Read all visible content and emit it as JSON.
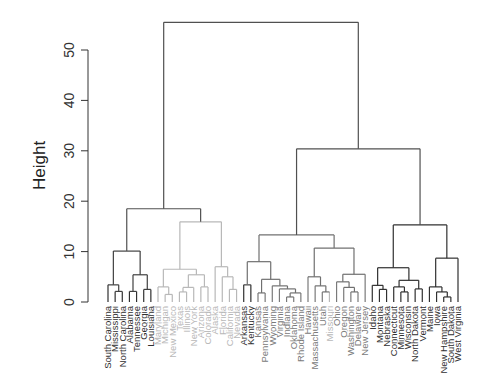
{
  "chart_data": {
    "type": "dendrogram",
    "title": "",
    "xlabel": "",
    "ylabel": "Height",
    "ylim": [
      0,
      55.5
    ],
    "yticks": [
      0,
      10,
      20,
      30,
      40,
      50
    ],
    "leaves": [
      {
        "label": "South Carolina",
        "color": "#303030"
      },
      {
        "label": "Mississippi",
        "color": "#303030"
      },
      {
        "label": "North Carolina",
        "color": "#303030"
      },
      {
        "label": "Alabama",
        "color": "#303030"
      },
      {
        "label": "Tennessee",
        "color": "#303030"
      },
      {
        "label": "Georgia",
        "color": "#303030"
      },
      {
        "label": "Louisiana",
        "color": "#303030"
      },
      {
        "label": "Maryland",
        "color": "#b8b8b8"
      },
      {
        "label": "Michigan",
        "color": "#b8b8b8"
      },
      {
        "label": "New Mexico",
        "color": "#b8b8b8"
      },
      {
        "label": "Texas",
        "color": "#b8b8b8"
      },
      {
        "label": "Illinois",
        "color": "#b8b8b8"
      },
      {
        "label": "New York",
        "color": "#b8b8b8"
      },
      {
        "label": "Arizona",
        "color": "#b8b8b8"
      },
      {
        "label": "Colorado",
        "color": "#b8b8b8"
      },
      {
        "label": "Alaska",
        "color": "#b8b8b8"
      },
      {
        "label": "Florida",
        "color": "#b8b8b8"
      },
      {
        "label": "California",
        "color": "#b8b8b8"
      },
      {
        "label": "Nevada",
        "color": "#b8b8b8"
      },
      {
        "label": "Arkansas",
        "color": "#303030"
      },
      {
        "label": "Kentucky",
        "color": "#303030"
      },
      {
        "label": "Kansas",
        "color": "#7a7a7a"
      },
      {
        "label": "Pennsylvania",
        "color": "#7a7a7a"
      },
      {
        "label": "Wyoming",
        "color": "#7a7a7a"
      },
      {
        "label": "Virginia",
        "color": "#7a7a7a"
      },
      {
        "label": "Indiana",
        "color": "#7a7a7a"
      },
      {
        "label": "Oklahoma",
        "color": "#7a7a7a"
      },
      {
        "label": "Rhode Island",
        "color": "#7a7a7a"
      },
      {
        "label": "Hawaii",
        "color": "#7a7a7a"
      },
      {
        "label": "Massachusetts",
        "color": "#7a7a7a"
      },
      {
        "label": "Utah",
        "color": "#7a7a7a"
      },
      {
        "label": "Missouri",
        "color": "#b8b8b8"
      },
      {
        "label": "Ohio",
        "color": "#7a7a7a"
      },
      {
        "label": "Oregon",
        "color": "#7a7a7a"
      },
      {
        "label": "Washington",
        "color": "#7a7a7a"
      },
      {
        "label": "Delaware",
        "color": "#7a7a7a"
      },
      {
        "label": "New Jersey",
        "color": "#7a7a7a"
      },
      {
        "label": "Idaho",
        "color": "#303030"
      },
      {
        "label": "Montana",
        "color": "#303030"
      },
      {
        "label": "Nebraska",
        "color": "#303030"
      },
      {
        "label": "Connecticut",
        "color": "#303030"
      },
      {
        "label": "Minnesota",
        "color": "#303030"
      },
      {
        "label": "Wisconsin",
        "color": "#303030"
      },
      {
        "label": "North Dakota",
        "color": "#303030"
      },
      {
        "label": "Vermont",
        "color": "#303030"
      },
      {
        "label": "Maine",
        "color": "#303030"
      },
      {
        "label": "Iowa",
        "color": "#303030"
      },
      {
        "label": "New Hampshire",
        "color": "#303030"
      },
      {
        "label": "South Dakota",
        "color": "#303030"
      },
      {
        "label": "West Virginia",
        "color": "#303030"
      }
    ],
    "tree": {
      "h": 55.5,
      "c": "#505050",
      "k": [
        {
          "h": 18.5,
          "c": "#505050",
          "k": [
            {
              "h": 10.1,
              "c": "#404040",
              "k": [
                {
                  "h": 3.4,
                  "c": "#404040",
                  "k": [
                    0,
                    {
                      "h": 2.1,
                      "c": "#404040",
                      "k": [
                        1,
                        2
                      ]
                    }
                  ]
                },
                {
                  "h": 5.4,
                  "c": "#404040",
                  "k": [
                    {
                      "h": 2.1,
                      "c": "#404040",
                      "k": [
                        3,
                        4
                      ]
                    },
                    {
                      "h": 2.5,
                      "c": "#404040",
                      "k": [
                        5,
                        6
                      ]
                    }
                  ]
                }
              ]
            },
            {
              "h": 15.9,
              "c": "#b8b8b8",
              "k": [
                {
                  "h": 6.5,
                  "c": "#b8b8b8",
                  "k": [
                    {
                      "h": 3.0,
                      "c": "#b8b8b8",
                      "k": [
                        7,
                        {
                          "h": 1.5,
                          "c": "#b8b8b8",
                          "k": [
                            8,
                            9
                          ]
                        }
                      ]
                    },
                    {
                      "h": 5.4,
                      "c": "#b8b8b8",
                      "k": [
                        {
                          "h": 2.9,
                          "c": "#b8b8b8",
                          "k": [
                            {
                              "h": 2.0,
                              "c": "#b8b8b8",
                              "k": [
                                10,
                                11
                              ]
                            },
                            12
                          ]
                        },
                        {
                          "h": 3.0,
                          "c": "#b8b8b8",
                          "k": [
                            13,
                            14
                          ]
                        }
                      ]
                    }
                  ]
                },
                {
                  "h": 7.0,
                  "c": "#b8b8b8",
                  "k": [
                    15,
                    {
                      "h": 5.0,
                      "c": "#b8b8b8",
                      "k": [
                        16,
                        {
                          "h": 2.5,
                          "c": "#b8b8b8",
                          "k": [
                            17,
                            18
                          ]
                        }
                      ]
                    }
                  ]
                }
              ]
            }
          ]
        },
        {
          "h": 30.4,
          "c": "#505050",
          "k": [
            {
              "h": 13.3,
              "c": "#707070",
              "k": [
                {
                  "h": 8.0,
                  "c": "#707070",
                  "k": [
                    {
                      "h": 3.4,
                      "c": "#404040",
                      "k": [
                        19,
                        20
                      ]
                    },
                    {
                      "h": 4.5,
                      "c": "#707070",
                      "k": [
                        {
                          "h": 1.8,
                          "c": "#707070",
                          "k": [
                            21,
                            22
                          ]
                        },
                        {
                          "h": 3.2,
                          "c": "#707070",
                          "k": [
                            23,
                            {
                              "h": 2.6,
                              "c": "#707070",
                              "k": [
                                24,
                                {
                                  "h": 1.8,
                                  "c": "#707070",
                                  "k": [
                                    {
                                      "h": 1.0,
                                      "c": "#707070",
                                      "k": [
                                        25,
                                        26
                                      ]
                                    },
                                    27
                                  ]
                                }
                              ]
                            }
                          ]
                        }
                      ]
                    }
                  ]
                },
                {
                  "h": 10.7,
                  "c": "#707070",
                  "k": [
                    {
                      "h": 5.0,
                      "c": "#707070",
                      "k": [
                        28,
                        {
                          "h": 3.2,
                          "c": "#707070",
                          "k": [
                            29,
                            {
                              "h": 2.0,
                              "c": "#707070",
                              "k": [
                                30,
                                31
                              ]
                            }
                          ]
                        }
                      ]
                    },
                    {
                      "h": 5.5,
                      "c": "#707070",
                      "k": [
                        {
                          "h": 4.0,
                          "c": "#707070",
                          "k": [
                            32,
                            {
                              "h": 2.9,
                              "c": "#707070",
                              "k": [
                                33,
                                {
                                  "h": 2.0,
                                  "c": "#707070",
                                  "k": [
                                    34,
                                    35
                                  ]
                                }
                              ]
                            }
                          ]
                        },
                        36
                      ]
                    }
                  ]
                }
              ]
            },
            {
              "h": 15.3,
              "c": "#303030",
              "k": [
                {
                  "h": 6.8,
                  "c": "#303030",
                  "k": [
                    {
                      "h": 3.3,
                      "c": "#303030",
                      "k": [
                        37,
                        {
                          "h": 2.5,
                          "c": "#303030",
                          "k": [
                            38,
                            39
                          ]
                        }
                      ]
                    },
                    {
                      "h": 4.3,
                      "c": "#303030",
                      "k": [
                        {
                          "h": 3.0,
                          "c": "#303030",
                          "k": [
                            40,
                            {
                              "h": 2.0,
                              "c": "#303030",
                              "k": [
                                41,
                                42
                              ]
                            }
                          ]
                        },
                        {
                          "h": 2.6,
                          "c": "#303030",
                          "k": [
                            43,
                            44
                          ]
                        }
                      ]
                    }
                  ]
                },
                {
                  "h": 8.7,
                  "c": "#303030",
                  "k": [
                    {
                      "h": 3.0,
                      "c": "#303030",
                      "k": [
                        45,
                        {
                          "h": 2.0,
                          "c": "#303030",
                          "k": [
                            46,
                            {
                              "h": 1.0,
                              "c": "#303030",
                              "k": [
                                47,
                                48
                              ]
                            }
                          ]
                        }
                      ]
                    },
                    49
                  ]
                }
              ]
            }
          ]
        }
      ]
    }
  }
}
